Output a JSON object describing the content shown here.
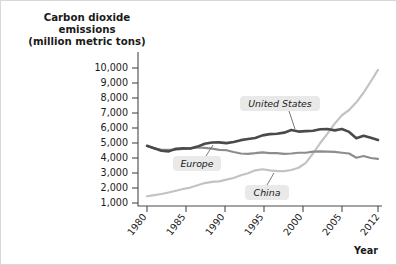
{
  "chart_data": {
    "type": "line",
    "title": "Carbon dioxide emissions (million metric tons)",
    "title_lines": [
      "Carbon dioxide",
      "emissions",
      "(million metric tons)"
    ],
    "xlabel": "Year",
    "ylabel": "Carbon dioxide emissions (million metric tons)",
    "xlim": [
      1980,
      2012
    ],
    "ylim": [
      0,
      10600
    ],
    "grid": false,
    "legend_position": "inline-callouts",
    "xtick_labels": [
      "1980",
      "1985",
      "1990",
      "1995",
      "2000",
      "2005",
      "2012"
    ],
    "xticks": [
      1980,
      1985,
      1990,
      1995,
      2000,
      2005,
      2012
    ],
    "ytick_labels": [
      "1,000",
      "2,000",
      "3,000",
      "4,000",
      "5,000",
      "6,000",
      "7,000",
      "8,000",
      "9,000",
      "10,000"
    ],
    "yticks": [
      1000,
      2000,
      3000,
      4000,
      5000,
      6000,
      7000,
      8000,
      9000,
      10000
    ],
    "x": [
      1980,
      1981,
      1982,
      1983,
      1984,
      1985,
      1986,
      1987,
      1988,
      1989,
      1990,
      1991,
      1992,
      1993,
      1994,
      1995,
      1996,
      1997,
      1998,
      1999,
      2000,
      2001,
      2002,
      2003,
      2004,
      2005,
      2006,
      2007,
      2008,
      2009,
      2010,
      2011,
      2012
    ],
    "series": [
      {
        "name": "United States",
        "color": "#4a4a4a",
        "values": [
          4810,
          4650,
          4480,
          4440,
          4620,
          4640,
          4630,
          4760,
          4950,
          5030,
          5040,
          4990,
          5070,
          5190,
          5270,
          5330,
          5510,
          5590,
          5620,
          5690,
          5860,
          5760,
          5790,
          5820,
          5920,
          5930,
          5840,
          5930,
          5740,
          5320,
          5480,
          5350,
          5200
        ]
      },
      {
        "name": "Europe",
        "color": "#8d8d8d",
        "values": [
          4800,
          4640,
          4550,
          4540,
          4560,
          4600,
          4640,
          4700,
          4680,
          4620,
          4540,
          4520,
          4400,
          4300,
          4280,
          4320,
          4380,
          4330,
          4320,
          4280,
          4300,
          4350,
          4350,
          4430,
          4440,
          4420,
          4410,
          4350,
          4300,
          4020,
          4130,
          4000,
          3940
        ]
      },
      {
        "name": "China",
        "color": "#c3c3c3",
        "values": [
          1450,
          1520,
          1600,
          1700,
          1820,
          1930,
          2030,
          2180,
          2330,
          2410,
          2440,
          2560,
          2670,
          2850,
          2980,
          3180,
          3250,
          3180,
          3130,
          3130,
          3200,
          3350,
          3680,
          4300,
          5000,
          5620,
          6290,
          6850,
          7200,
          7710,
          8350,
          9100,
          9870
        ]
      }
    ],
    "annotations": [
      {
        "label": "United States",
        "series": "United States",
        "x": 1996
      },
      {
        "label": "Europe",
        "series": "Europe",
        "x": 1988
      },
      {
        "label": "China",
        "series": "China",
        "x": 2000
      }
    ]
  }
}
